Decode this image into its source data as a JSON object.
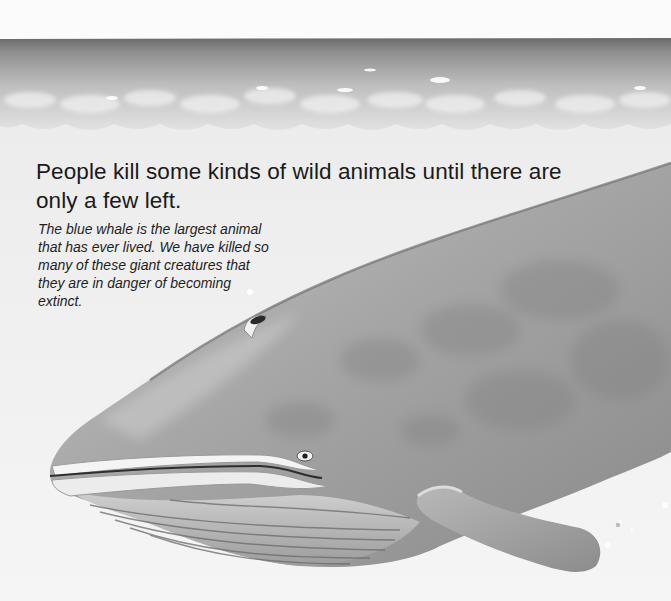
{
  "page": {
    "heading_lines": [
      "People kill some kinds of wild animals until there are",
      "only a few left."
    ],
    "caption_lines": [
      "The blue whale is the largest animal",
      "that has ever lived. We have killed so",
      "many of these giant creatures that",
      "they are in danger of becoming",
      "extinct."
    ]
  },
  "illustration": {
    "subject": "blue-whale",
    "scene": "ocean-surface-and-underwater",
    "colors": {
      "sky": "#fbfbfb",
      "sea_horizon": "#6e6e6e",
      "sea_surface": "#b9b9b9",
      "underwater": "#f2f2f2",
      "whale_body": "#9a9a9a",
      "whale_highlight": "#c8c8c8",
      "whale_dark": "#6a6a6a"
    }
  }
}
